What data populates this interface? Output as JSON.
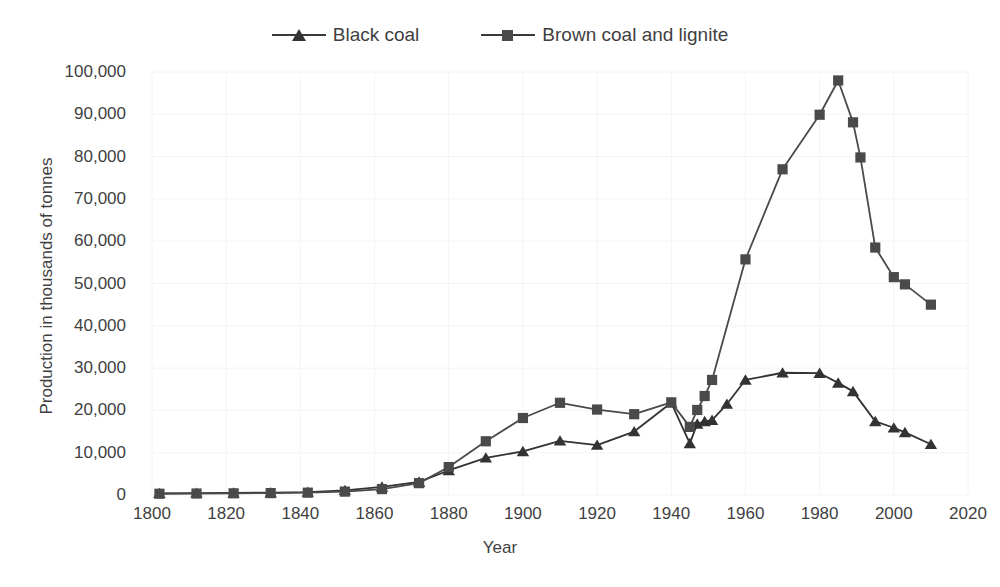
{
  "chart_data": {
    "type": "line",
    "title": "",
    "xlabel": "Year",
    "ylabel": "Production in thousands of tonnes",
    "xlim": [
      1795,
      2025
    ],
    "ylim": [
      0,
      100000
    ],
    "grid": true,
    "legend_position": "top-center",
    "y_ticks": [
      "0",
      "10,000",
      "20,000",
      "30,000",
      "40,000",
      "50,000",
      "60,000",
      "70,000",
      "80,000",
      "90,000",
      "100,000"
    ],
    "y_tick_values": [
      0,
      10000,
      20000,
      30000,
      40000,
      50000,
      60000,
      70000,
      80000,
      90000,
      100000
    ],
    "x_ticks": [
      "1800",
      "1820",
      "1840",
      "1860",
      "1880",
      "1900",
      "1920",
      "1940",
      "1960",
      "1980",
      "2000",
      "2020"
    ],
    "x_tick_values": [
      1800,
      1820,
      1840,
      1860,
      1880,
      1900,
      1920,
      1940,
      1960,
      1980,
      2000,
      2020
    ],
    "series": [
      {
        "name": "Black coal",
        "marker": "triangle",
        "color": "#333333",
        "points": [
          [
            1802,
            400
          ],
          [
            1812,
            450
          ],
          [
            1822,
            500
          ],
          [
            1832,
            550
          ],
          [
            1842,
            700
          ],
          [
            1852,
            1100
          ],
          [
            1862,
            1900
          ],
          [
            1872,
            3100
          ],
          [
            1880,
            5800
          ],
          [
            1890,
            8800
          ],
          [
            1900,
            10300
          ],
          [
            1910,
            12800
          ],
          [
            1920,
            11800
          ],
          [
            1930,
            15000
          ],
          [
            1940,
            21800
          ],
          [
            1945,
            12200
          ],
          [
            1947,
            16800
          ],
          [
            1949,
            17400
          ],
          [
            1951,
            17700
          ],
          [
            1955,
            21500
          ],
          [
            1960,
            27200
          ],
          [
            1970,
            28900
          ],
          [
            1980,
            28800
          ],
          [
            1985,
            26500
          ],
          [
            1989,
            24500
          ],
          [
            1995,
            17400
          ],
          [
            2000,
            15900
          ],
          [
            2003,
            14800
          ],
          [
            2010,
            12000
          ]
        ]
      },
      {
        "name": "Brown coal and lignite",
        "marker": "square",
        "color": "#4a4a4a",
        "points": [
          [
            1802,
            300
          ],
          [
            1812,
            350
          ],
          [
            1822,
            400
          ],
          [
            1832,
            450
          ],
          [
            1842,
            550
          ],
          [
            1852,
            800
          ],
          [
            1862,
            1400
          ],
          [
            1872,
            2800
          ],
          [
            1880,
            6600
          ],
          [
            1890,
            12700
          ],
          [
            1900,
            18200
          ],
          [
            1910,
            21800
          ],
          [
            1920,
            20200
          ],
          [
            1930,
            19100
          ],
          [
            1940,
            21900
          ],
          [
            1945,
            16100
          ],
          [
            1947,
            20100
          ],
          [
            1949,
            23400
          ],
          [
            1951,
            27200
          ],
          [
            1960,
            55700
          ],
          [
            1970,
            77000
          ],
          [
            1980,
            89900
          ],
          [
            1985,
            98000
          ],
          [
            1989,
            88100
          ],
          [
            1991,
            79800
          ],
          [
            1995,
            58500
          ],
          [
            2000,
            51500
          ],
          [
            2003,
            49800
          ],
          [
            2010,
            45000
          ]
        ]
      }
    ]
  },
  "legend": {
    "items": [
      {
        "label": "Black coal",
        "marker": "triangle"
      },
      {
        "label": "Brown coal and lignite",
        "marker": "square"
      }
    ]
  },
  "axes": {
    "y_title": "Production in thousands of tonnes",
    "x_title": "Year"
  },
  "colors": {
    "black_coal": "#333333",
    "brown_coal": "#4a4a4a",
    "text": "#3f3f3f",
    "gridline": "#f4f4f4",
    "background": "#ffffff"
  }
}
